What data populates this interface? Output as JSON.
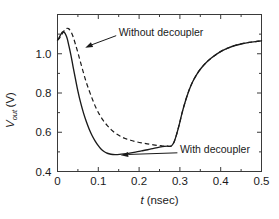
{
  "chart_data": {
    "type": "line",
    "title": "",
    "xlabel": "t (nsec)",
    "xlabel_symbol": "t",
    "xlabel_unit": "(nsec)",
    "ylabel": "Vout (V)",
    "ylabel_symbol": "V",
    "ylabel_sub": "out",
    "ylabel_unit": "(V)",
    "xlim": [
      0,
      0.5
    ],
    "ylim": [
      0.4,
      1.2
    ],
    "xticks": [
      0,
      0.1,
      0.2,
      0.3,
      0.4,
      0.5
    ],
    "xtick_labels": [
      "0",
      "0.1",
      "0.2",
      "0.3",
      "0.4",
      "0.5"
    ],
    "yticks": [
      0.4,
      0.6,
      0.8,
      1.0
    ],
    "ytick_labels": [
      "0.4",
      "0.6",
      "0.8",
      "1.0"
    ],
    "minor_xticks": [
      0.05,
      0.15,
      0.25,
      0.35,
      0.45
    ],
    "minor_yticks": [
      0.5,
      0.7,
      0.9,
      1.1
    ],
    "grid": false,
    "legend_position": "inline-annotations",
    "series": [
      {
        "name": "With decoupler",
        "style": "solid",
        "color": "#1a1a1a",
        "x": [
          0.0,
          0.004,
          0.008,
          0.011,
          0.014,
          0.017,
          0.02,
          0.024,
          0.028,
          0.033,
          0.038,
          0.044,
          0.05,
          0.057,
          0.064,
          0.071,
          0.078,
          0.085,
          0.092,
          0.099,
          0.106,
          0.114,
          0.122,
          0.131,
          0.141,
          0.152,
          0.164,
          0.177,
          0.191,
          0.206,
          0.221,
          0.236,
          0.25,
          0.262,
          0.27,
          0.275,
          0.28,
          0.286,
          0.292,
          0.299,
          0.306,
          0.314,
          0.322,
          0.331,
          0.341,
          0.352,
          0.364,
          0.377,
          0.39,
          0.404,
          0.419,
          0.435,
          0.452,
          0.47,
          0.485,
          0.5
        ],
        "y": [
          1.07,
          1.082,
          1.098,
          1.108,
          1.112,
          1.108,
          1.098,
          1.076,
          1.04,
          0.992,
          0.936,
          0.872,
          0.81,
          0.748,
          0.696,
          0.652,
          0.614,
          0.582,
          0.556,
          0.534,
          0.516,
          0.502,
          0.493,
          0.488,
          0.486,
          0.487,
          0.49,
          0.494,
          0.499,
          0.505,
          0.511,
          0.518,
          0.524,
          0.528,
          0.529,
          0.528,
          0.532,
          0.552,
          0.59,
          0.644,
          0.704,
          0.762,
          0.812,
          0.856,
          0.894,
          0.926,
          0.954,
          0.978,
          0.998,
          1.016,
          1.03,
          1.042,
          1.051,
          1.058,
          1.062,
          1.066
        ]
      },
      {
        "name": "Without decoupler",
        "style": "dashed",
        "color": "#1a1a1a",
        "x": [
          0.0,
          0.005,
          0.01,
          0.014,
          0.018,
          0.021,
          0.024,
          0.027,
          0.03,
          0.034,
          0.039,
          0.044,
          0.05,
          0.056,
          0.063,
          0.07,
          0.078,
          0.086,
          0.094,
          0.103,
          0.112,
          0.122,
          0.132,
          0.143,
          0.154,
          0.166,
          0.179,
          0.192,
          0.206,
          0.22,
          0.235,
          0.248,
          0.258,
          0.265,
          0.27,
          0.275,
          0.28,
          0.286,
          0.292,
          0.299,
          0.306,
          0.314,
          0.322,
          0.331,
          0.341,
          0.352,
          0.364,
          0.377,
          0.39,
          0.404,
          0.419,
          0.435,
          0.452,
          0.47,
          0.485,
          0.5
        ],
        "y": [
          1.068,
          1.08,
          1.096,
          1.11,
          1.122,
          1.128,
          1.13,
          1.128,
          1.122,
          1.108,
          1.082,
          1.048,
          1.006,
          0.96,
          0.908,
          0.858,
          0.81,
          0.766,
          0.726,
          0.69,
          0.66,
          0.634,
          0.612,
          0.594,
          0.58,
          0.568,
          0.559,
          0.552,
          0.546,
          0.541,
          0.536,
          0.532,
          0.53,
          0.529,
          0.529,
          0.528,
          0.532,
          0.552,
          0.59,
          0.644,
          0.704,
          0.762,
          0.812,
          0.856,
          0.894,
          0.926,
          0.954,
          0.978,
          0.998,
          1.016,
          1.03,
          1.042,
          1.051,
          1.058,
          1.062,
          1.066
        ]
      }
    ],
    "annotations": [
      {
        "id": "without-decoupler",
        "text": "Without decoupler",
        "text_x": 0.15,
        "text_y": 1.11,
        "points_to_x": 0.068,
        "points_to_y": 1.03
      },
      {
        "id": "with-decoupler",
        "text": "With decoupler",
        "text_x": 0.3,
        "text_y": 0.513,
        "points_to_x": 0.155,
        "points_to_y": 0.483
      }
    ]
  },
  "colors": {
    "axis": "#3a3a3a",
    "series": "#1a1a1a",
    "background": "#ffffff"
  }
}
